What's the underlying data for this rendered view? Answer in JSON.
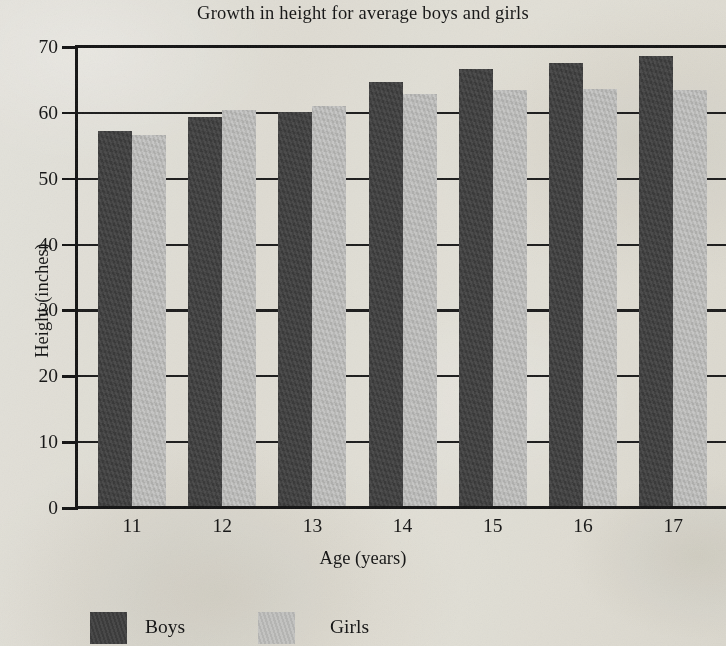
{
  "chart_data": {
    "type": "bar",
    "title": "Growth in height for average boys and girls",
    "xlabel": "Age (years)",
    "ylabel": "Height (inches)",
    "categories": [
      "11",
      "12",
      "13",
      "14",
      "15",
      "16",
      "17"
    ],
    "series": [
      {
        "name": "Boys",
        "color": "#3b3b3b",
        "values": [
          57.3,
          59.4,
          60.2,
          64.7,
          66.7,
          67.6,
          68.7
        ]
      },
      {
        "name": "Girls",
        "color": "#bcbcba",
        "values": [
          56.7,
          60.5,
          61.1,
          62.8,
          63.4,
          63.7,
          63.5
        ]
      }
    ],
    "ylim": [
      0,
      70
    ],
    "yticks": [
      0,
      10,
      20,
      30,
      40,
      50,
      60,
      70
    ],
    "ytick_labels": [
      "0",
      "10",
      "20",
      "30",
      "40",
      "50",
      "60",
      "70"
    ],
    "grid": true,
    "legend_position": "bottom-left",
    "note": "right edge of plot is cropped by the image boundary"
  },
  "legend": {
    "boys_label": "Boys",
    "girls_label": "Girls"
  },
  "colors": {
    "boys": "#3b3b3b",
    "girls": "#bcbcba",
    "axis": "#131313",
    "paper": "#efeeea"
  }
}
